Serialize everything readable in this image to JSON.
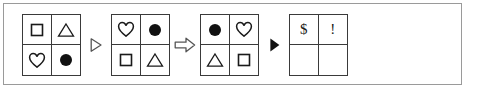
{
  "puzzle": {
    "type": "visual-analogy-sequence",
    "frame_border_color": "#9a9a9a",
    "grid_border_color": "#3a3a3a",
    "shape_stroke_color": "#1a1a1a",
    "shape_fill_color": "#111111",
    "panels": [
      {
        "name": "panel-1",
        "cells": [
          {
            "position": "top-left",
            "symbol": "square-outline"
          },
          {
            "position": "top-right",
            "symbol": "triangle-outline"
          },
          {
            "position": "bottom-left",
            "symbol": "heart-outline"
          },
          {
            "position": "bottom-right",
            "symbol": "circle-filled"
          }
        ]
      },
      {
        "name": "panel-2",
        "cells": [
          {
            "position": "top-left",
            "symbol": "heart-outline"
          },
          {
            "position": "top-right",
            "symbol": "circle-filled"
          },
          {
            "position": "bottom-left",
            "symbol": "square-outline"
          },
          {
            "position": "bottom-right",
            "symbol": "triangle-outline"
          }
        ]
      },
      {
        "name": "panel-3",
        "cells": [
          {
            "position": "top-left",
            "symbol": "circle-filled"
          },
          {
            "position": "top-right",
            "symbol": "heart-outline"
          },
          {
            "position": "bottom-left",
            "symbol": "triangle-outline"
          },
          {
            "position": "bottom-right",
            "symbol": "square-outline"
          }
        ]
      },
      {
        "name": "panel-4",
        "cells": [
          {
            "position": "top-left",
            "symbol": "dollar-sign",
            "text": "$"
          },
          {
            "position": "top-right",
            "symbol": "exclamation-mark",
            "text": "!"
          },
          {
            "position": "bottom-left",
            "symbol": "empty",
            "text": ""
          },
          {
            "position": "bottom-right",
            "symbol": "empty",
            "text": ""
          }
        ]
      }
    ],
    "separators": [
      {
        "name": "separator-1",
        "symbol": "triangle-right-outline-icon"
      },
      {
        "name": "separator-2",
        "symbol": "block-arrow-right-outline-icon"
      },
      {
        "name": "separator-3",
        "symbol": "triangle-right-filled-icon"
      }
    ]
  }
}
